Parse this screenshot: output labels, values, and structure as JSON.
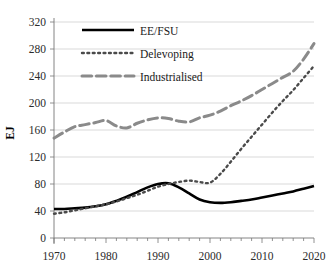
{
  "chart_data": {
    "type": "line",
    "title": "",
    "xlabel": "",
    "ylabel": "EJ",
    "xlim": [
      1970,
      2020
    ],
    "ylim": [
      0,
      320
    ],
    "ytick_step": 40,
    "xtick_step": 10,
    "xminor_step": 2,
    "grid": true,
    "legend_position": "top-left-inside",
    "yticks": [
      "0",
      "40",
      "80",
      "120",
      "160",
      "200",
      "240",
      "280",
      "320"
    ],
    "xticks": [
      "1970",
      "1980",
      "1990",
      "2000",
      "2010",
      "2020"
    ],
    "x": [
      1970,
      1972,
      1974,
      1976,
      1978,
      1980,
      1982,
      1984,
      1986,
      1988,
      1990,
      1992,
      1994,
      1996,
      1998,
      2000,
      2002,
      2004,
      2006,
      2008,
      2010,
      2012,
      2014,
      2016,
      2018,
      2020
    ],
    "series": [
      {
        "name": "EE/FSU",
        "style": "solid",
        "color": "#000000",
        "width": 2.6,
        "values": [
          43,
          43,
          44,
          45,
          47,
          50,
          55,
          61,
          68,
          75,
          80,
          81,
          75,
          66,
          57,
          53,
          52,
          53,
          55,
          57,
          60,
          63,
          66,
          69,
          73,
          77
        ]
      },
      {
        "name": "Delevoping",
        "style": "dotted",
        "color": "#4a4a4a",
        "width": 2.4,
        "values": [
          36,
          38,
          41,
          44,
          47,
          50,
          54,
          59,
          64,
          70,
          76,
          80,
          83,
          85,
          83,
          82,
          95,
          113,
          132,
          150,
          168,
          186,
          203,
          219,
          237,
          255
        ]
      },
      {
        "name": "Industrialised",
        "style": "dashed",
        "color": "#8a8a8a",
        "width": 3.0,
        "values": [
          148,
          157,
          165,
          168,
          171,
          174,
          166,
          163,
          170,
          175,
          178,
          177,
          173,
          172,
          178,
          182,
          188,
          196,
          203,
          211,
          220,
          229,
          238,
          247,
          265,
          288
        ]
      }
    ]
  },
  "legend": {
    "items": [
      {
        "label": "EE/FSU"
      },
      {
        "label": "Delevoping"
      },
      {
        "label": "Industrialised"
      }
    ]
  }
}
